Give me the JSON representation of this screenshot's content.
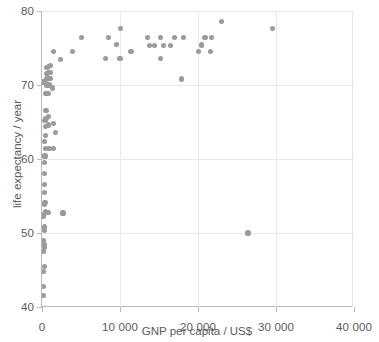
{
  "chart_data": {
    "type": "scatter",
    "title": "",
    "xlabel": "GNP per capita / US$",
    "ylabel": "life expectancy / year",
    "xlim": [
      0,
      40000
    ],
    "ylim": [
      40,
      80
    ],
    "xticks": [
      0,
      10000,
      20000,
      30000,
      40000
    ],
    "xticklabels": [
      "0",
      "10 000",
      "20 000",
      "30 000",
      "40 000"
    ],
    "yticks": [
      40,
      50,
      60,
      70,
      80
    ],
    "yticklabels": [
      "40",
      "50",
      "60",
      "70",
      "80"
    ],
    "grid": true,
    "grid_axes": "both",
    "legend": null,
    "marker": {
      "shape": "circle",
      "color": "#9a9a9a",
      "size_px": 5.2
    },
    "series": [
      {
        "name": "countries",
        "points": [
          [
            180,
            41.5
          ],
          [
            240,
            42.8
          ],
          [
            200,
            44.8
          ],
          [
            320,
            45.5
          ],
          [
            230,
            47.5
          ],
          [
            300,
            48.0
          ],
          [
            260,
            48.5
          ],
          [
            210,
            49.0
          ],
          [
            280,
            50.3
          ],
          [
            350,
            50.8
          ],
          [
            240,
            52.3
          ],
          [
            300,
            52.6
          ],
          [
            420,
            52.9
          ],
          [
            820,
            52.8
          ],
          [
            310,
            53.8
          ],
          [
            380,
            54.1
          ],
          [
            330,
            55.5
          ],
          [
            360,
            56.6
          ],
          [
            300,
            58.0
          ],
          [
            340,
            59.5
          ],
          [
            390,
            60.4
          ],
          [
            430,
            61.4
          ],
          [
            900,
            61.4
          ],
          [
            1520,
            61.4
          ],
          [
            360,
            62.4
          ],
          [
            420,
            63.2
          ],
          [
            1750,
            63.6
          ],
          [
            400,
            64.4
          ],
          [
            850,
            64.6
          ],
          [
            1480,
            64.8
          ],
          [
            380,
            65.2
          ],
          [
            470,
            65.4
          ],
          [
            560,
            65.5
          ],
          [
            880,
            65.7
          ],
          [
            420,
            66.5
          ],
          [
            560,
            66.6
          ],
          [
            520,
            68.8
          ],
          [
            760,
            68.9
          ],
          [
            1380,
            69.6
          ],
          [
            600,
            69.9
          ],
          [
            760,
            70.0
          ],
          [
            890,
            70.1
          ],
          [
            180,
            70.4
          ],
          [
            620,
            70.8
          ],
          [
            820,
            70.9
          ],
          [
            980,
            70.9
          ],
          [
            1120,
            70.9
          ],
          [
            580,
            71.5
          ],
          [
            740,
            71.6
          ],
          [
            880,
            71.7
          ],
          [
            1040,
            71.7
          ],
          [
            640,
            72.4
          ],
          [
            800,
            72.5
          ],
          [
            1080,
            72.6
          ],
          [
            2400,
            73.5
          ],
          [
            8100,
            73.6
          ],
          [
            10000,
            73.6
          ],
          [
            15200,
            73.6
          ],
          [
            21600,
            74.5
          ],
          [
            20100,
            74.5
          ],
          [
            11400,
            74.5
          ],
          [
            3900,
            74.5
          ],
          [
            1520,
            74.5
          ],
          [
            13800,
            75.3
          ],
          [
            14400,
            75.3
          ],
          [
            15600,
            75.3
          ],
          [
            16500,
            75.3
          ],
          [
            20500,
            75.4
          ],
          [
            9600,
            75.5
          ],
          [
            5100,
            76.4
          ],
          [
            8500,
            76.4
          ],
          [
            13500,
            76.4
          ],
          [
            15200,
            76.4
          ],
          [
            17000,
            76.4
          ],
          [
            18100,
            76.4
          ],
          [
            20900,
            76.4
          ],
          [
            21700,
            76.4
          ],
          [
            10100,
            77.6
          ],
          [
            29600,
            77.6
          ],
          [
            23000,
            78.6
          ],
          [
            17900,
            70.8
          ],
          [
            2700,
            52.7
          ],
          [
            26400,
            50.0
          ]
        ]
      }
    ]
  }
}
